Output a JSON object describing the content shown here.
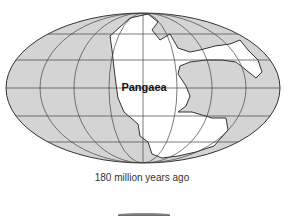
{
  "map": {
    "label": "Pangaea",
    "caption": "180 million years ago",
    "colors": {
      "ocean": "#d4d4d4",
      "land": "#ffffff",
      "lines": "#333333"
    }
  }
}
